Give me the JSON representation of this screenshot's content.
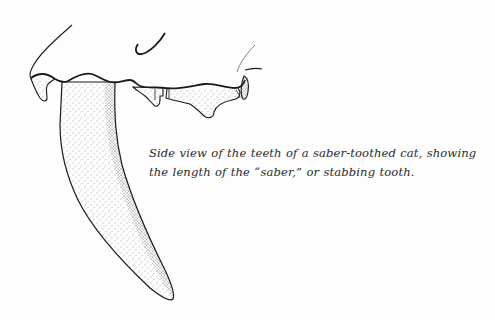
{
  "figure": {
    "caption_lines": [
      "Side view of the teeth of a saber-toothed cat, showing",
      "the length of the “saber,” or stabbing tooth."
    ]
  },
  "colors": {
    "ink": "#1a1a1a",
    "stipple": "#555555",
    "paper": "#fdfdfd"
  }
}
